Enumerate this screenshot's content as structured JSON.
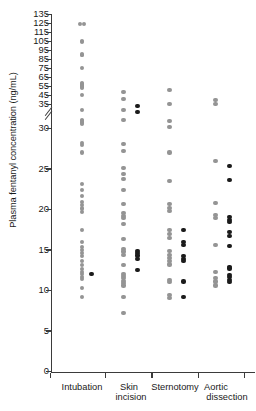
{
  "chart_data": {
    "type": "scatter",
    "title": "",
    "subtitle": "",
    "xlabel": "",
    "ylabel": "Plasma fentanyl concentration (ng/mL)",
    "grid": false,
    "legend": null,
    "axis_break": {
      "present": true,
      "lower_segment_range": [
        0,
        32
      ],
      "upper_segment_range": [
        35,
        135
      ],
      "note": "y-axis has a break between the main 0-32 region and the upper 35-135 region"
    },
    "ylim_lower": [
      0,
      32
    ],
    "ylim_upper": [
      35,
      135
    ],
    "yticks_lower": [
      0,
      5,
      10,
      15,
      20,
      25,
      30
    ],
    "yticks_upper": [
      35,
      45,
      55,
      65,
      75,
      85,
      95,
      105,
      115,
      125,
      135
    ],
    "ytick_labels_lower": [
      "0",
      "5",
      "10",
      "15",
      "20",
      "25",
      "30"
    ],
    "ytick_labels_upper": [
      "35",
      "45",
      "55",
      "65",
      "75",
      "85",
      "95",
      "105",
      "115",
      "125",
      "135"
    ],
    "categories": [
      "Intubation",
      "Skin incision",
      "Sternotomy",
      "Aortic dissection"
    ],
    "category_labels": [
      [
        "Intubation"
      ],
      [
        "Skin",
        "incision"
      ],
      [
        "Sternotomy"
      ],
      [
        "Aortic",
        "dissection"
      ]
    ],
    "marker_styles": {
      "open": {
        "name": "open-gray-circle",
        "color": "#949494"
      },
      "filled": {
        "name": "filled-black-circle",
        "color": "#1b1b1b"
      }
    },
    "series": [
      {
        "name": "Intubation",
        "category_index": 0,
        "open_values": [
          124,
          124,
          105,
          104,
          90,
          89,
          75,
          58,
          57,
          56,
          55,
          54,
          53,
          45,
          32.2,
          31.0,
          30.9,
          30.7,
          30.5,
          28.2,
          27.9,
          27.0,
          23.1,
          22.4,
          21.6,
          20.9,
          20.5,
          20.1,
          19.7,
          17.4,
          16.0,
          15.4,
          15.0,
          14.6,
          14.2,
          13.6,
          13.1,
          12.6,
          12.3,
          12.0,
          11.7,
          11.4,
          10.3,
          9.2
        ],
        "filled_values": [
          12.0
        ]
      },
      {
        "name": "Skin incision",
        "category_index": 1,
        "open_values": [
          34.5,
          33.6,
          32.2,
          31.0,
          28.0,
          27.2,
          25.1,
          24.4,
          23.7,
          22.4,
          20.6,
          19.5,
          19.2,
          18.9,
          18.2,
          16.3,
          15.1,
          14.8,
          14.4,
          13.1,
          12.0,
          11.8,
          11.5,
          11.2,
          10.9,
          10.6,
          9.2,
          7.2
        ],
        "filled_values": [
          32.7,
          32.0,
          14.9,
          14.6,
          14.3,
          13.9,
          12.5
        ]
      },
      {
        "name": "Sternotomy",
        "category_index": 2,
        "open_values": [
          34.7,
          35.2,
          30.9,
          30.1,
          27.0,
          23.5,
          20.7,
          20.2,
          19.8,
          17.4,
          16.9,
          16.5,
          14.9,
          14.4,
          14.0,
          13.6,
          13.2,
          11.3,
          11.0,
          9.4,
          9.1
        ],
        "filled_values": [
          17.5,
          16.0,
          15.6,
          14.2,
          13.9,
          13.6,
          11.1,
          9.2
        ]
      },
      {
        "name": "Aortic dissection",
        "category_index": 3,
        "open_values": [
          35.0,
          33.5,
          26.0,
          20.8,
          19.3,
          18.9,
          15.6,
          12.3,
          11.5,
          11.1,
          10.6
        ],
        "filled_values": [
          25.3,
          23.6,
          19.1,
          18.7,
          18.4,
          17.2,
          16.7,
          15.5,
          12.9,
          12.7,
          11.9,
          11.6,
          11.3,
          11.0
        ]
      }
    ]
  }
}
